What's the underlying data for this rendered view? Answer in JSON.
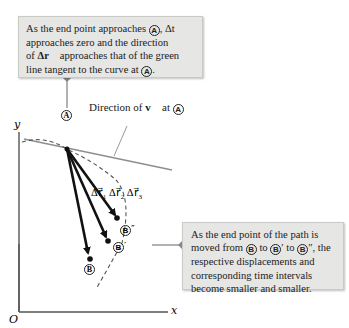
{
  "figure": {
    "top_callout": {
      "line1_pre": "As the end point approaches ",
      "line1_point": "A",
      "line1_post": ", Δt",
      "line2": "approaches zero and the direction",
      "line3_pre": "of ",
      "line3_vec": "Δr⃗",
      "line3_post": " approaches that of the green",
      "line4_pre": "line tangent to the curve at ",
      "line4_point": "A",
      "line4_post": "."
    },
    "right_callout": {
      "line1": "As the end point of the path is",
      "line2_pre": "moved from ",
      "line2_p1": "B",
      "line2_mid1": " to ",
      "line2_p2": "B",
      "line2_mid2": "′ to ",
      "line2_p3": "B",
      "line2_post": "″, the",
      "line3": "respective displacements and",
      "line4": "corresponding time intervals",
      "line5": "become smaller and smaller."
    },
    "tangent_label_pre": "Direction of ",
    "tangent_label_vec": "v⃗",
    "tangent_label_post": " at ",
    "tangent_label_point": "A",
    "axes": {
      "x": "x",
      "y": "y",
      "origin": "O"
    },
    "points": {
      "A": "A",
      "B": "B",
      "B_prime": "B",
      "B_double_prime": "B",
      "prime": "′",
      "double_prime": "″"
    },
    "vectors": [
      {
        "label": "Δr⃗",
        "sub": "1"
      },
      {
        "label": "Δr⃗",
        "sub": "2"
      },
      {
        "label": "Δr⃗",
        "sub": "3"
      }
    ],
    "colors": {
      "callout_bg": "#e6e6e4",
      "tangent_line": "#8a8a8a",
      "vectors": "#111111",
      "curve": "#444444",
      "axes": "#555555"
    }
  }
}
